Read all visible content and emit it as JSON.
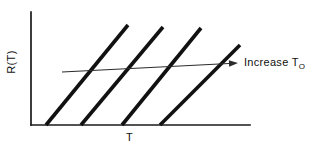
{
  "figure": {
    "type": "line-diagram",
    "background_color": "#ffffff",
    "ink_color": "#111111"
  },
  "axes": {
    "y_label": "R(T)",
    "x_label": "T",
    "origin": {
      "x": 31,
      "y": 125
    },
    "y_axis_top": {
      "x": 31,
      "y": 12
    },
    "x_axis_right": {
      "x": 250,
      "y": 125
    },
    "ticks": "none",
    "grid": "off"
  },
  "annotation": {
    "text_prefix": "Increase T",
    "text_subscript": "O",
    "full_text": "Increase T_O",
    "arrow_start": {
      "x": 62,
      "y": 72
    },
    "arrow_end": {
      "x": 238,
      "y": 63
    }
  },
  "chart_data": {
    "type": "line",
    "title": "",
    "xlabel": "T",
    "ylabel": "R(T)",
    "grid": "off",
    "legend": "none",
    "axis_style": "schematic-unscaled",
    "series": [
      {
        "name": "curve-1",
        "x": [
          46,
          128
        ],
        "y": [
          125,
          25
        ],
        "x_intercept": 46
      },
      {
        "name": "curve-2",
        "x": [
          81,
          163
        ],
        "y": [
          125,
          27
        ],
        "x_intercept": 81
      },
      {
        "name": "curve-3",
        "x": [
          122,
          201
        ],
        "y": [
          125,
          28
        ],
        "x_intercept": 122
      },
      {
        "name": "curve-4",
        "x": [
          160,
          240
        ],
        "y": [
          125,
          45
        ],
        "x_intercept": 160
      }
    ],
    "trend_arrow": {
      "name": "increase-T0-arrow",
      "x": [
        62,
        238
      ],
      "y": [
        72,
        63
      ],
      "label": "Increase T_O"
    }
  }
}
